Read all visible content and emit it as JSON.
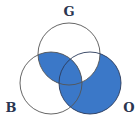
{
  "diagram": {
    "type": "venn-3",
    "labels": {
      "top": "G",
      "left": "B",
      "right": "O"
    },
    "shaded_regions": [
      "G∩B only",
      "G∩B∩O",
      "B∩O only",
      "O only"
    ],
    "unshaded_regions": [
      "G only",
      "B only",
      "G∩O only"
    ],
    "colors": {
      "fill": "#3b78c8",
      "outline": "#555555",
      "label": "#2a3550"
    }
  }
}
